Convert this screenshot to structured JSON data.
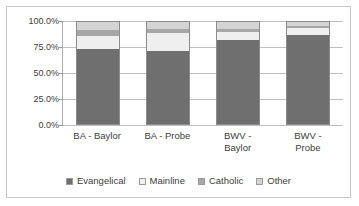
{
  "chart_data": {
    "type": "bar",
    "subtype": "100%-stacked-column",
    "title": "",
    "xlabel": "",
    "ylabel": "",
    "ylim": [
      0,
      100
    ],
    "yticks": [
      "0.0%",
      "25.0%",
      "50.0%",
      "75.0%",
      "100.0%"
    ],
    "ytick_values": [
      0,
      25,
      50,
      75,
      100
    ],
    "grid": true,
    "legend_position": "bottom",
    "categories": [
      "BA - Baylor",
      "BA - Probe",
      "BWV - Baylor",
      "BWV - Probe"
    ],
    "series": [
      {
        "name": "Evangelical",
        "color": "#6f6f6f",
        "values": [
          73.5,
          71.5,
          82.0,
          87.5
        ]
      },
      {
        "name": "Mainline",
        "color": "#efefef",
        "values": [
          13.0,
          18.0,
          8.0,
          6.5
        ]
      },
      {
        "name": "Catholic",
        "color": "#a6a6a6",
        "values": [
          5.5,
          4.0,
          3.5,
          2.0
        ]
      },
      {
        "name": "Other",
        "color": "#d4d4d4",
        "values": [
          8.0,
          6.5,
          6.5,
          4.0
        ]
      }
    ]
  },
  "axis": {
    "y_ticks": [
      {
        "label": "100.0%",
        "value": 100
      },
      {
        "label": "75.0%",
        "value": 75
      },
      {
        "label": "50.0%",
        "value": 50
      },
      {
        "label": "25.0%",
        "value": 25
      },
      {
        "label": "0.0%",
        "value": 0
      }
    ]
  },
  "categories": [
    {
      "label": "BA - Baylor",
      "lines": [
        "BA - Baylor"
      ]
    },
    {
      "label": "BA - Probe",
      "lines": [
        "BA - Probe"
      ]
    },
    {
      "label": "BWV - Baylor",
      "lines": [
        "BWV -",
        "Baylor"
      ]
    },
    {
      "label": "BWV - Probe",
      "lines": [
        "BWV -",
        "Probe"
      ]
    }
  ],
  "legend": {
    "items": [
      {
        "label": "Evangelical",
        "color": "#6f6f6f"
      },
      {
        "label": "Mainline",
        "color": "#efefef"
      },
      {
        "label": "Catholic",
        "color": "#a6a6a6"
      },
      {
        "label": "Other",
        "color": "#d4d4d4"
      }
    ]
  },
  "colors": {
    "border": "#c8c8c8",
    "gridline": "#bfbfbf",
    "axis": "#b0b0b0",
    "text": "#404040",
    "background": "#ffffff"
  }
}
